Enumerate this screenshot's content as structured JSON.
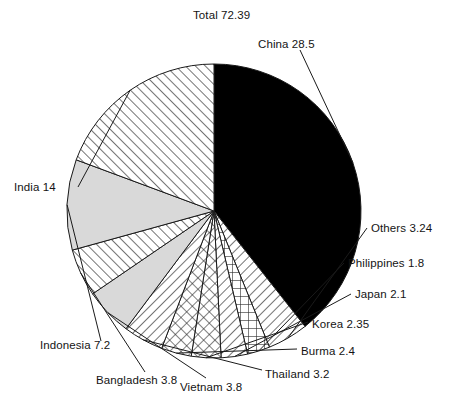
{
  "chart_data": {
    "type": "pie",
    "title": "Total 72.39",
    "total": 72.39,
    "units": "",
    "xlabel": "",
    "ylabel": "",
    "legend_position": "none",
    "grid": false,
    "start_angle_deg": 0,
    "direction": "clockwise",
    "categories": [
      "China",
      "Others",
      "Philippines",
      "Japan",
      "Korea",
      "Burma",
      "Thailand",
      "Vietnam",
      "Bangladesh",
      "Indonesia",
      "India"
    ],
    "values": [
      28.5,
      3.24,
      1.8,
      2.1,
      2.35,
      2.4,
      3.2,
      3.8,
      3.8,
      7.2,
      14
    ],
    "labels": [
      "China 28.5",
      "Others 3.24",
      "Philippines 1.8",
      "Japan 2.1",
      "Korea 2.35",
      "Burma 2.4",
      "Thailand 3.2",
      "Vietnam 3.8",
      "Bangladesh 3.8",
      "Indonesia 7.2",
      "India 14"
    ],
    "slice_fills": [
      "solid-black",
      "diagonal-hatch-left",
      "grid-hatch",
      "diagonal-hatch-left",
      "cross-hatch",
      "cross-hatch",
      "diagonal-hatch-left",
      "solid-lightgray",
      "diagonal-hatch-right",
      "solid-lightgray",
      "diagonal-hatch-right"
    ],
    "colors": {
      "black": "#000000",
      "light_gray": "#d9d9d9",
      "outline": "#1a1a1a",
      "background": "#ffffff"
    }
  },
  "labels": {
    "title": "Total 72.39",
    "china": "China 28.5",
    "others": "Others 3.24",
    "philippines": "Philippines 1.8",
    "japan": "Japan 2.1",
    "korea": "Korea 2.35",
    "burma": "Burma 2.4",
    "thailand": "Thailand 3.2",
    "vietnam": "Vietnam 3.8",
    "bangladesh": "Bangladesh 3.8",
    "indonesia": "Indonesia 7.2",
    "india": "India 14"
  }
}
